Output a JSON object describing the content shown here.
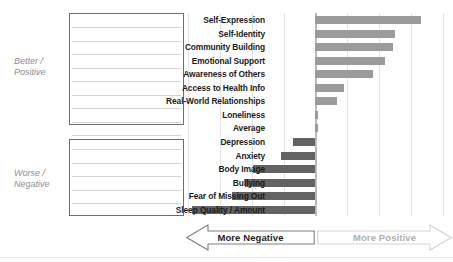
{
  "groups": {
    "positive_caption": "Better /\nPositive",
    "negative_caption": "Worse /\nNegative"
  },
  "axis": {
    "negative_label": "More Negative",
    "positive_label": "More Positive",
    "negative_arrow_icon": "arrow-left-icon",
    "positive_arrow_icon": "arrow-right-icon"
  },
  "colors": {
    "positive_bar": "#9b9b9b",
    "negative_bar": "#636363",
    "gridline": "#e2e2e2",
    "zero_axis": "#b9b9b9",
    "box_border": "#6e6e6e",
    "caption_text": "#8d8d8d",
    "negative_arrow_text": "#1f1f1f",
    "positive_arrow_text": "#b0b0b0"
  },
  "chart_data": {
    "type": "bar",
    "orientation": "horizontal",
    "title": "",
    "subtitle": "",
    "xlabel": "",
    "ylabel": "",
    "grid": true,
    "legend": "none",
    "xlim": [
      -4,
      4
    ],
    "gridline_values": [
      -4,
      -3,
      -2,
      -1,
      0,
      1,
      2,
      3,
      4
    ],
    "zero_reference": 0,
    "categories": [
      "Self-Expression",
      "Self-Identity",
      "Community Building",
      "Emotional Support",
      "Awareness of Others",
      "Access to Health Info",
      "Real-World Relationships",
      "Loneliness",
      "Average",
      "Depression",
      "Anxiety",
      "Body Image",
      "Bullying",
      "Fear of Missing Out",
      "Sleep Quality / Amount"
    ],
    "values": [
      3.3,
      2.5,
      2.45,
      2.2,
      1.8,
      0.9,
      0.7,
      0.09,
      0.09,
      -0.7,
      -1.05,
      -1.95,
      -2.2,
      -2.6,
      -3.85
    ],
    "group_of_category": [
      "positive",
      "positive",
      "positive",
      "positive",
      "positive",
      "positive",
      "positive",
      "positive",
      "average",
      "negative",
      "negative",
      "negative",
      "negative",
      "negative",
      "negative"
    ]
  }
}
